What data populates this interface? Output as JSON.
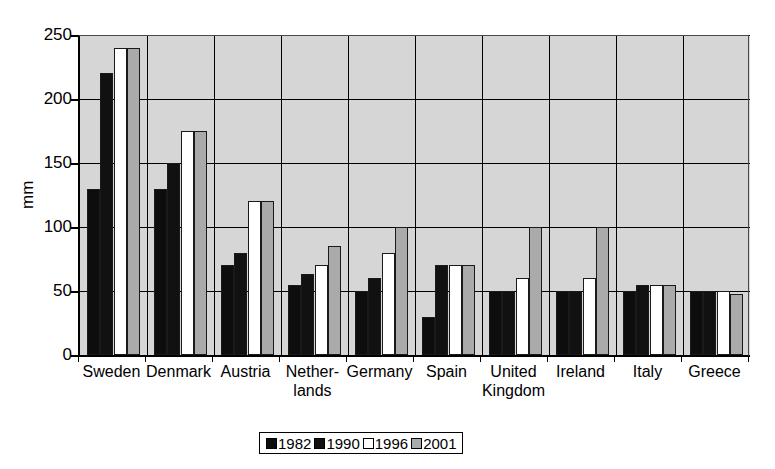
{
  "chart_data": {
    "type": "bar",
    "title": "",
    "xlabel": "",
    "ylabel": "mm",
    "ylim": [
      0,
      250
    ],
    "yticks": [
      0,
      50,
      100,
      150,
      200,
      250
    ],
    "ytick_labels": [
      "0",
      "50",
      "100",
      "150",
      "200",
      "250"
    ],
    "grid": true,
    "legend_position": "bottom-center",
    "categories": [
      "Sweden",
      "Denmark",
      "Austria",
      "Nether-\nlands",
      "Germany",
      "Spain",
      "United\nKingdom",
      "Ireland",
      "Italy",
      "Greece"
    ],
    "category_lines": [
      [
        "Sweden"
      ],
      [
        "Denmark"
      ],
      [
        "Austria"
      ],
      [
        "Nether-",
        "lands"
      ],
      [
        "Germany"
      ],
      [
        "Spain"
      ],
      [
        "United",
        "Kingdom"
      ],
      [
        "Ireland"
      ],
      [
        "Italy"
      ],
      [
        "Greece"
      ]
    ],
    "series": [
      {
        "name": "1982",
        "color": "#0d0d0d",
        "values": [
          130,
          130,
          70,
          55,
          50,
          30,
          50,
          50,
          50,
          50
        ]
      },
      {
        "name": "1990",
        "color": "#111111",
        "values": [
          220,
          150,
          80,
          63,
          60,
          70,
          50,
          50,
          55,
          50
        ]
      },
      {
        "name": "1996",
        "color": "#ffffff",
        "values": [
          240,
          175,
          120,
          70,
          80,
          70,
          60,
          60,
          55,
          50
        ]
      },
      {
        "name": "2001",
        "color": "#aaaaaa",
        "values": [
          240,
          175,
          120,
          85,
          100,
          70,
          100,
          100,
          55,
          48
        ]
      }
    ]
  },
  "legend": {
    "items": [
      {
        "label": "1982",
        "color": "#0d0d0d"
      },
      {
        "label": "1990",
        "color": "#111111"
      },
      {
        "label": "1996",
        "color": "#ffffff"
      },
      {
        "label": "2001",
        "color": "#aaaaaa"
      }
    ]
  },
  "axis": {
    "y_label": "mm"
  }
}
